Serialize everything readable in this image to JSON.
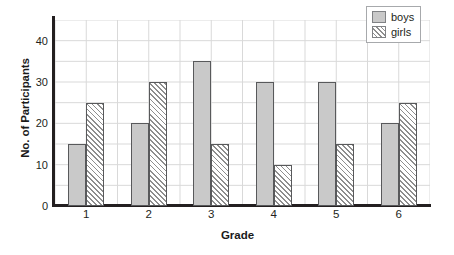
{
  "chart_data": {
    "type": "bar",
    "title": "",
    "xlabel": "Grade",
    "ylabel": "No. of Participants",
    "categories": [
      "1",
      "2",
      "3",
      "4",
      "5",
      "6"
    ],
    "series": [
      {
        "name": "boys",
        "values": [
          15,
          20,
          35,
          30,
          30,
          20
        ],
        "color": "#c9c9c9",
        "fill": "solid"
      },
      {
        "name": "girls",
        "values": [
          25,
          30,
          15,
          10,
          15,
          25
        ],
        "color": "#ffffff",
        "fill": "diagonal-hatch"
      }
    ],
    "ylim": [
      0,
      45
    ],
    "yticks": [
      0,
      10,
      20,
      30,
      40
    ],
    "ytick_labels": [
      "0",
      "10",
      "20",
      "30",
      "40"
    ],
    "gridline_step": 5,
    "grid": true,
    "grid_color": "#d9d9d9",
    "axis_color": "#231f20",
    "legend_position": "top-right",
    "legend_entries": [
      "boys",
      "girls"
    ]
  }
}
